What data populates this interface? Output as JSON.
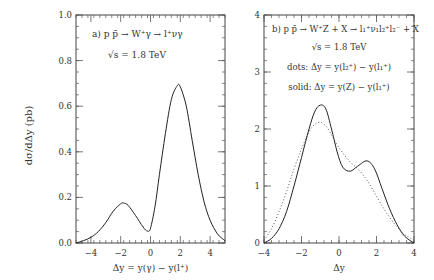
{
  "ylabel": "dσ/dΔy  (pb)",
  "chart_data": [
    {
      "type": "line",
      "panel": "a",
      "title": "a)  p p̄ → W⁺γ → l⁺νγ",
      "subtitle": "√s = 1.8 TeV",
      "xlabel": "Δy = y(γ) − y(l⁺)",
      "ylabel": "dσ/dΔy  (pb)",
      "xlim": [
        -5,
        5
      ],
      "ylim": [
        0,
        1.0
      ],
      "xticks": [
        -4,
        -2,
        0,
        2,
        4
      ],
      "yticks": [
        0.0,
        0.2,
        0.4,
        0.6,
        0.8,
        1.0
      ],
      "ytick_labels": [
        "0.0",
        "0.2",
        "0.4",
        "0.6",
        "0.8",
        "1.0"
      ],
      "series": [
        {
          "name": "solid",
          "style": "solid",
          "x": [
            -5.0,
            -4.5,
            -4.0,
            -3.5,
            -3.0,
            -2.5,
            -2.0,
            -1.8,
            -1.5,
            -1.0,
            -0.5,
            -0.2,
            0.0,
            0.3,
            0.6,
            1.0,
            1.4,
            1.8,
            2.0,
            2.4,
            2.8,
            3.2,
            3.6,
            4.0,
            4.5,
            5.0
          ],
          "y": [
            0.0,
            0.01,
            0.025,
            0.05,
            0.09,
            0.14,
            0.172,
            0.175,
            0.165,
            0.12,
            0.07,
            0.052,
            0.065,
            0.16,
            0.3,
            0.48,
            0.63,
            0.69,
            0.685,
            0.6,
            0.45,
            0.3,
            0.18,
            0.1,
            0.04,
            0.01
          ]
        }
      ]
    },
    {
      "type": "line",
      "panel": "b",
      "title": "b)  p p̄ → W⁺Z + X → l₁⁺ν₁l₂⁺l₂⁻ + X",
      "subtitle": "√s = 1.8 TeV",
      "annotations": [
        "dots: Δy = y(l₂⁺) − y(l₁⁺)",
        "solid: Δy = y(Z) − y(l₁⁺)"
      ],
      "xlabel": "Δy",
      "ylabel": "dσ/dΔy  (pb)",
      "xlim": [
        -4,
        4
      ],
      "ylim": [
        0,
        4
      ],
      "xticks": [
        -4,
        -2,
        0,
        2,
        4
      ],
      "yticks": [
        0,
        1,
        2,
        3,
        4
      ],
      "series": [
        {
          "name": "solid: Δy = y(Z) − y(l₁⁺)",
          "style": "solid",
          "x": [
            -4.0,
            -3.6,
            -3.2,
            -2.8,
            -2.4,
            -2.0,
            -1.6,
            -1.3,
            -1.0,
            -0.7,
            -0.4,
            -0.1,
            0.2,
            0.6,
            1.0,
            1.5,
            1.9,
            2.3,
            2.7,
            3.1,
            3.5,
            4.0
          ],
          "y": [
            0.0,
            0.08,
            0.25,
            0.55,
            1.0,
            1.5,
            2.0,
            2.3,
            2.42,
            2.35,
            2.0,
            1.6,
            1.33,
            1.26,
            1.35,
            1.44,
            1.3,
            0.95,
            0.6,
            0.32,
            0.12,
            0.0
          ]
        },
        {
          "name": "dots: Δy = y(l₂⁺) − y(l₁⁺)",
          "style": "dotted",
          "x": [
            -4.0,
            -3.6,
            -3.2,
            -2.8,
            -2.4,
            -2.0,
            -1.6,
            -1.3,
            -1.0,
            -0.7,
            -0.4,
            -0.1,
            0.2,
            0.6,
            1.0,
            1.5,
            1.9,
            2.3,
            2.7,
            3.1,
            3.5,
            4.0
          ],
          "y": [
            0.05,
            0.25,
            0.55,
            0.9,
            1.3,
            1.65,
            1.95,
            2.08,
            2.12,
            2.05,
            1.9,
            1.72,
            1.58,
            1.42,
            1.3,
            1.1,
            0.88,
            0.65,
            0.45,
            0.28,
            0.15,
            0.05
          ]
        }
      ]
    }
  ]
}
